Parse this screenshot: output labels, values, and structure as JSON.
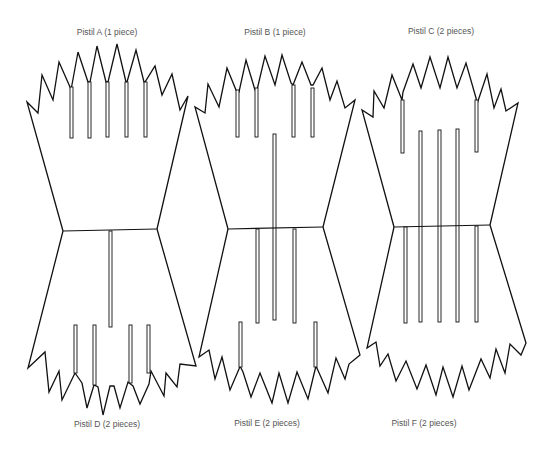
{
  "figure": {
    "title_cropped": "",
    "stroke_color": "#111111",
    "label_color": "#555555",
    "pieces": [
      {
        "id": "A",
        "label": "Pistil A (1 piece)",
        "position": "top-left"
      },
      {
        "id": "B",
        "label": "Pistil B (1 piece)",
        "position": "top-center"
      },
      {
        "id": "C",
        "label": "Pistil C (2 pieces)",
        "position": "top-right"
      },
      {
        "id": "D",
        "label": "Pistil D (2 pieces)",
        "position": "bottom-left"
      },
      {
        "id": "E",
        "label": "Pistil E (2 pieces)",
        "position": "bottom-center"
      },
      {
        "id": "F",
        "label": "Pistil F (2 pieces)",
        "position": "bottom-right"
      }
    ]
  }
}
